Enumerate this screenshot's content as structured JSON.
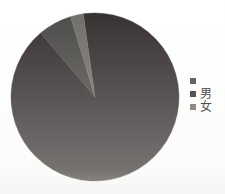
{
  "chart_data": {
    "type": "pie",
    "title": "",
    "subtitle": "",
    "xlabel": "",
    "ylabel": "",
    "grid": false,
    "legend_position": "right",
    "start_angle_deg": -8,
    "direction": "clockwise",
    "categories": [
      "",
      "男",
      "女"
    ],
    "values": [
      91.0,
      6.5,
      2.5
    ],
    "slices": [
      {
        "label": "",
        "value": 91.0,
        "color": "#332d2d"
      },
      {
        "label": "男",
        "value": 6.5,
        "color": "#4a4846"
      },
      {
        "label": "女",
        "value": 2.5,
        "color": "#6e6c69"
      }
    ],
    "annotations": []
  },
  "legend": {
    "entries": [
      {
        "label": "",
        "color": "#4a4846"
      },
      {
        "label": "男",
        "color": "#332d2d"
      },
      {
        "label": "女",
        "color": "#6e6c69"
      }
    ]
  },
  "colors": {
    "slice_dark": "#332d2d",
    "slice_medium": "#4a4846",
    "slice_light": "#6e6c69",
    "background": "#ffffff",
    "text": "#231f1f"
  },
  "geometry": {
    "center_x": 95,
    "center_y": 97,
    "radius": 84
  }
}
